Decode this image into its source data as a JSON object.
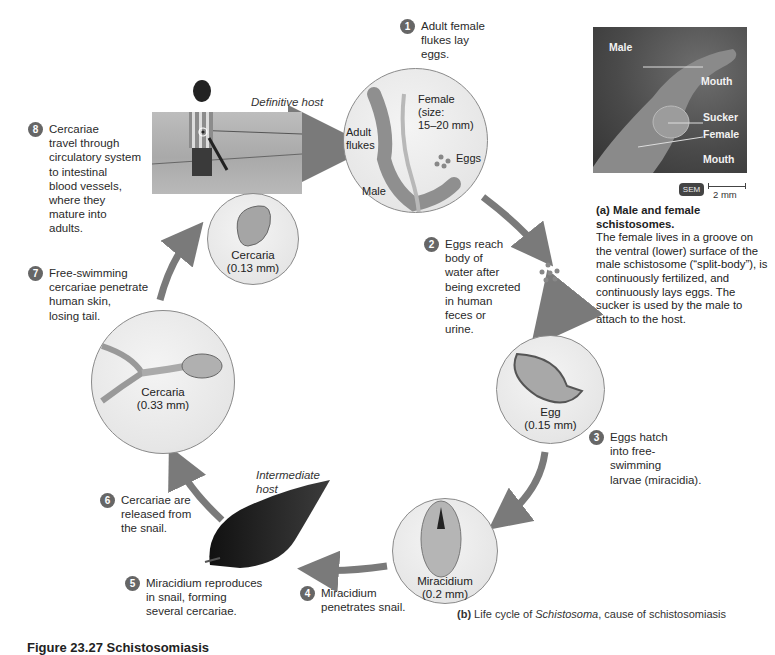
{
  "figure": {
    "title": "Figure 23.27 Schistosomiasis",
    "caption_b_prefix": "(b)",
    "caption_b_text": " Life cycle of ",
    "caption_b_italic": "Schistosoma",
    "caption_b_suffix": ", cause of schistosomiasis"
  },
  "panel_a": {
    "micrograph_labels": [
      "Male",
      "Mouth",
      "Sucker",
      "Female",
      "Mouth"
    ],
    "badge": "SEM",
    "scale_bar": "2 mm",
    "caption_title": "(a) Male and female schistosomes.",
    "caption_body": "The female lives in a groove on the ventral (lower) surface of the male schistosome (“split-body”), is continuously fertilized, and continuously lays eggs. The sucker is used by the male to attach to the host."
  },
  "hosts": {
    "definitive": "Definitive host",
    "intermediate": "Intermediate\nhost"
  },
  "circles": {
    "adult": {
      "labels": {
        "adult_flukes": "Adult\nflukes",
        "female": "Female\n(size:\n15–20 mm)",
        "eggs": "Eggs",
        "male": "Male"
      }
    },
    "egg": {
      "label": "Egg\n(0.15 mm)"
    },
    "miracidium": {
      "label": "Miracidium\n(0.2 mm)"
    },
    "cercaria_large": {
      "label": "Cercaria\n(0.33 mm)"
    },
    "cercaria_small": {
      "label": "Cercaria\n(0.13 mm)"
    }
  },
  "steps": [
    {
      "n": "1",
      "text": "Adult female\nflukes lay\neggs."
    },
    {
      "n": "2",
      "text": "Eggs reach\nbody of\nwater after\nbeing excreted\nin human\nfeces or\nurine."
    },
    {
      "n": "3",
      "text": "Eggs hatch\ninto free-\nswimming\nlarvae (miracidia)."
    },
    {
      "n": "4",
      "text": "Miracidium\npenetrates snail."
    },
    {
      "n": "5",
      "text": "Miracidium reproduces\nin snail, forming\nseveral cercariae."
    },
    {
      "n": "6",
      "text": "Cercariae are\nreleased from\nthe snail."
    },
    {
      "n": "7",
      "text": "Free-swimming\ncercariae penetrate\nhuman skin,\nlosing tail."
    },
    {
      "n": "8",
      "text": "Cercariae\ntravel through\ncirculatory system\nto intestinal\nblood vessels,\nwhere they\nmature into\nadults."
    }
  ],
  "colors": {
    "arrow": "#7a7a7a",
    "badge": "#666666",
    "circle_border": "#8a8a8a"
  }
}
